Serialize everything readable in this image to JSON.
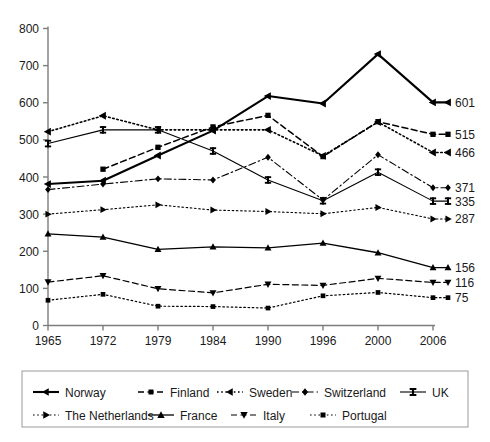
{
  "chart_data": {
    "type": "line",
    "title": "",
    "subtitle": "",
    "xlabel": "",
    "ylabel": "",
    "x": [
      1965,
      1972,
      1979,
      1984,
      1990,
      1996,
      2000,
      2006
    ],
    "categories": [
      "1965",
      "1972",
      "1979",
      "1984",
      "1990",
      "1996",
      "2000",
      "2006"
    ],
    "ylim": [
      0,
      800
    ],
    "yticks": [
      0,
      100,
      200,
      300,
      400,
      500,
      600,
      700,
      800
    ],
    "ytick_labels": [
      "0",
      "100",
      "200",
      "300",
      "400",
      "500",
      "600",
      "700",
      "800"
    ],
    "grid": false,
    "legend_position": "bottom",
    "series": [
      {
        "name": "Norway",
        "marker": "left-triangle",
        "dash": "solid",
        "width": 2.1,
        "values": [
          381,
          390,
          458,
          525,
          618,
          598,
          731,
          601
        ],
        "end_label": "601"
      },
      {
        "name": "Finland",
        "marker": "square",
        "dash": "dashed",
        "width": 1.5,
        "values": [
          null,
          421,
          480,
          535,
          566,
          455,
          549,
          515
        ],
        "end_label": "515"
      },
      {
        "name": "Sweden",
        "marker": "left-triangle",
        "dash": "dotted",
        "width": 1.6,
        "values": [
          522,
          565,
          527,
          527,
          527,
          457,
          548,
          466
        ],
        "end_label": "466"
      },
      {
        "name": "Switzerland",
        "marker": "diamond",
        "dash": "dashdot",
        "width": 1.1,
        "values": [
          366,
          381,
          395,
          392,
          453,
          338,
          460,
          371
        ],
        "end_label": "371"
      },
      {
        "name": "UK",
        "marker": "ibeam",
        "dash": "solid",
        "width": 1.1,
        "values": [
          490,
          527,
          527,
          470,
          392,
          336,
          413,
          335
        ],
        "end_label": "335"
      },
      {
        "name": "The Netherlands",
        "marker": "right-triangle",
        "dash": "dotted",
        "width": 1.1,
        "values": [
          300,
          312,
          325,
          311,
          307,
          301,
          318,
          287
        ],
        "end_label": "287"
      },
      {
        "name": "France",
        "marker": "up-triangle",
        "dash": "solid",
        "width": 1.3,
        "values": [
          247,
          238,
          205,
          212,
          209,
          222,
          196,
          156
        ],
        "end_label": "156"
      },
      {
        "name": "Italy",
        "marker": "down-triangle",
        "dash": "dashed",
        "width": 1.2,
        "values": [
          117,
          134,
          99,
          88,
          111,
          108,
          127,
          116
        ],
        "end_label": "116"
      },
      {
        "name": "Portugal",
        "marker": "square",
        "dash": "dotted",
        "width": 1.2,
        "values": [
          68,
          84,
          52,
          51,
          47,
          80,
          89,
          75
        ],
        "end_label": "75"
      }
    ]
  },
  "legend": {
    "row1": [
      "Norway",
      "Finland",
      "Sweden",
      "Switzerland",
      "UK"
    ],
    "row2": [
      "The Netherlands",
      "France",
      "Italy",
      "Portugal"
    ]
  },
  "colors": {
    "line": "#000000",
    "axis": "#7d7d7d",
    "text": "#1a1a1a",
    "legend_border": "#9a9a9a",
    "background": "#ffffff"
  }
}
